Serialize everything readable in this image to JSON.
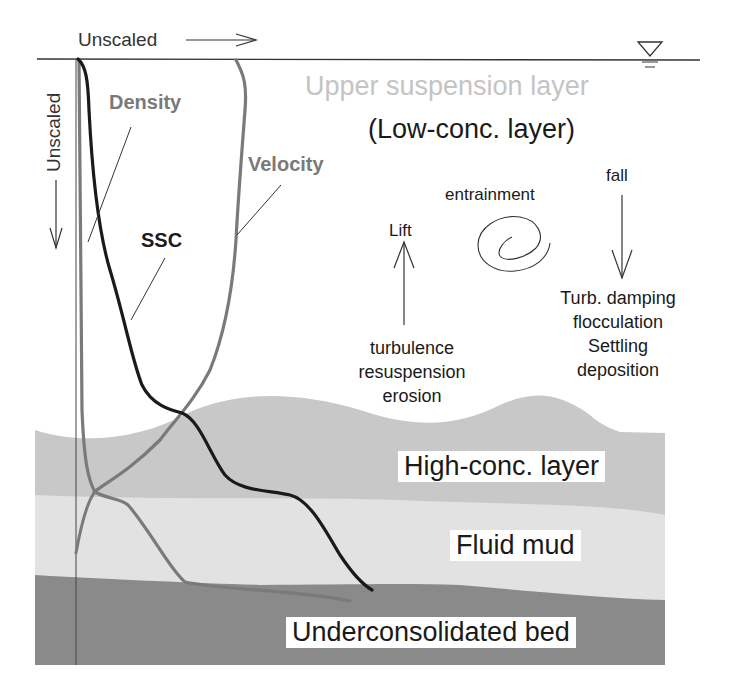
{
  "axes": {
    "x_label": "Unscaled",
    "y_label": "Unscaled"
  },
  "profiles": {
    "density": "Density",
    "velocity": "Velocity",
    "ssc": "SSC"
  },
  "layers": {
    "upper": "Upper suspension layer",
    "low_conc": "(Low-conc. layer)",
    "high_conc": "High-conc. layer",
    "fluid_mud": "Fluid mud",
    "bed": "Underconsolidated bed"
  },
  "processes": {
    "lift": "Lift",
    "entrainment": "entrainment",
    "fall": "fall",
    "up_causes": [
      "turbulence",
      "resuspension",
      "erosion"
    ],
    "down_causes": [
      "Turb. damping",
      "flocculation",
      "Settling",
      "deposition"
    ]
  },
  "colors": {
    "background": "#ffffff",
    "high_conc_layer": "#c8c8c8",
    "fluid_mud_layer": "#e2e2e2",
    "bed_layer": "#8a8a8a",
    "upper_label": "#c4c4c4",
    "density_curve": "#7a7a7a",
    "velocity_curve": "#7a7a7a",
    "ssc_curve": "#1a1a1a",
    "text": "#1a1a1a"
  }
}
